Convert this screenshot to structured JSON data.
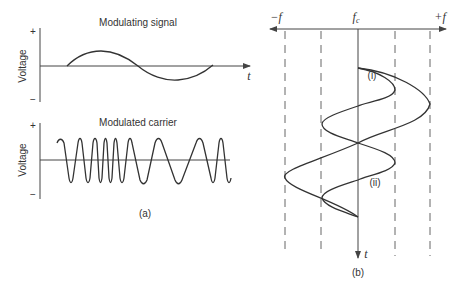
{
  "panel_a": {
    "caption": "(a)",
    "top_plot": {
      "title": "Modulating signal",
      "ylabel": "Voltage",
      "y_plus": "+",
      "y_minus": "−",
      "xlabel": "t"
    },
    "bottom_plot": {
      "title": "Modulated carrier",
      "ylabel": "Voltage",
      "y_plus": "+",
      "y_minus": "−"
    }
  },
  "panel_b": {
    "caption": "(b)",
    "axis_left_label": "−f",
    "axis_center_label": "f",
    "axis_center_subscript": "c",
    "axis_right_label": "+f",
    "time_label": "t",
    "curve_i_label": "(i)",
    "curve_ii_label": "(ii)"
  },
  "colors": {
    "line": "#333333",
    "background": "#ffffff"
  }
}
